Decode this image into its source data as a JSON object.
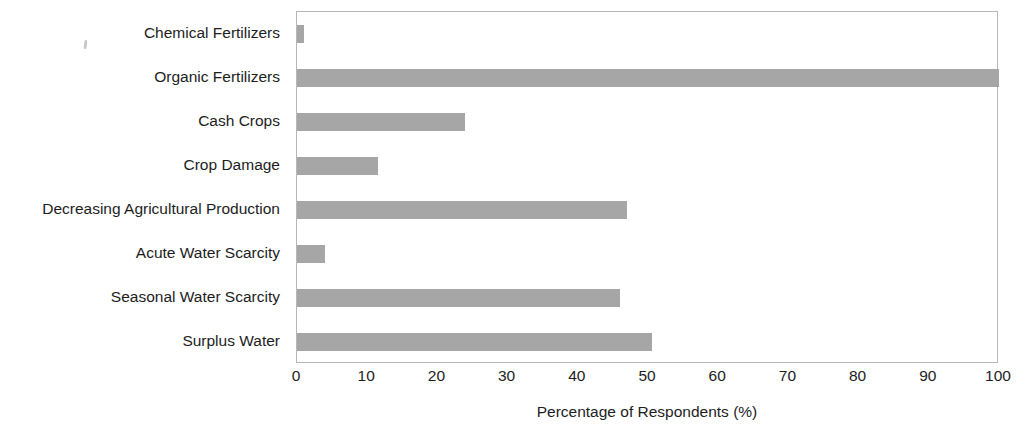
{
  "chart_data": {
    "type": "bar",
    "orientation": "horizontal",
    "title": "",
    "xlabel": "Percentage of Respondents (%)",
    "ylabel": "",
    "xlim": [
      0,
      100
    ],
    "xticks": [
      0,
      10,
      20,
      30,
      40,
      50,
      60,
      70,
      80,
      90,
      100
    ],
    "grid": false,
    "legend": false,
    "bar_color": "#a6a6a6",
    "plot_border_color": "#b7b7b7",
    "text_color": "#1d1d1d",
    "categories": [
      "Chemical Fertilizers",
      "Organic Fertilizers",
      "Cash Crops",
      "Crop Damage",
      "Decreasing Agricultural Production",
      "Acute Water Scarcity",
      "Seasonal Water Scarcity",
      "Surplus Water"
    ],
    "values": [
      1,
      100,
      24,
      11.5,
      47,
      4,
      46,
      50.5
    ]
  }
}
